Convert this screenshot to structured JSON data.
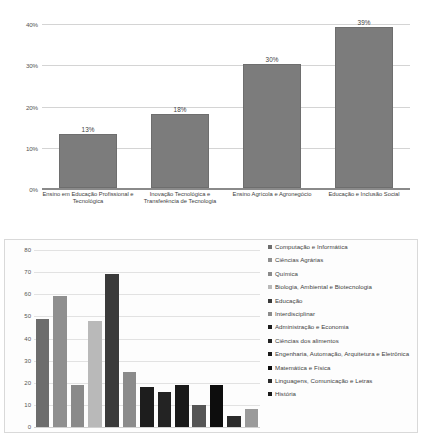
{
  "chart_data": [
    {
      "type": "bar",
      "id": "top-chart",
      "title": "",
      "xlabel": "",
      "ylabel": "",
      "ylim": [
        0,
        40
      ],
      "grid": true,
      "legend": "none",
      "ytick_labels": [
        "40%",
        "30%",
        "20%",
        "10%",
        "0%"
      ],
      "yticks": [
        40,
        30,
        20,
        10,
        0
      ],
      "categories": [
        "Ensino em Educação Profissional e Tecnológica",
        "Inovação Tecnológica e Transferência de Tecnologia",
        "Ensino Agrícola e Agronegócio",
        "Educação e Inclusão Social"
      ],
      "values": [
        13,
        18,
        30,
        39
      ],
      "data_labels": [
        "13%",
        "18%",
        "30%",
        "39%"
      ],
      "bar_color": "#7c7c7c"
    },
    {
      "type": "bar",
      "id": "bottom-chart",
      "title": "",
      "xlabel": "",
      "ylabel": "",
      "ylim": [
        0,
        80
      ],
      "grid": true,
      "legend": "right",
      "ytick_labels": [
        "80",
        "70",
        "60",
        "50",
        "40",
        "30",
        "20",
        "10",
        "0"
      ],
      "yticks": [
        80,
        70,
        60,
        50,
        40,
        30,
        20,
        10,
        0
      ],
      "categories": [
        "Computação e Informática",
        "Ciências Agrárias",
        "Química",
        "Biologia, Ambiental e Biotecnologia",
        "Educação",
        "Interdisciplinar",
        "Administração e Economia",
        "Ciências dos alimentos",
        "Engenharia, Automação, Arquitetura e Eletrônica",
        "Matemática e Física",
        "Linguagens, Comunicação e Letras",
        "História"
      ],
      "values": [
        49,
        59,
        19,
        48,
        69,
        25,
        18,
        16,
        19,
        10,
        19,
        5
      ],
      "extra_values": [
        8
      ],
      "bar_colors": [
        "#6d6d6d",
        "#8f8f8f",
        "#8a8a8a",
        "#b9b9b9",
        "#3a3a3a",
        "#8b8b8b",
        "#1d1d1d",
        "#232323",
        "#1a1a1a",
        "#555555",
        "#0d0d0d",
        "#2b2b2b",
        "#9a9a9a"
      ],
      "legend_swatch_colors": [
        "#6d6d6d",
        "#8f8f8f",
        "#8a8a8a",
        "#b9b9b9",
        "#3a3a3a",
        "#8b8b8b",
        "#1d1d1d",
        "#232323",
        "#1a1a1a",
        "#0d0d0d",
        "#2b2b2b",
        "#1a1a1a"
      ]
    }
  ],
  "top_chart": {
    "yticks": [
      {
        "label": "40%",
        "value": 40
      },
      {
        "label": "30%",
        "value": 30
      },
      {
        "label": "20%",
        "value": 20
      },
      {
        "label": "10%",
        "value": 10
      },
      {
        "label": "0%",
        "value": 0
      }
    ],
    "bars": [
      {
        "label": "Ensino em Educação Profissional e Tecnológica",
        "value": 13,
        "data_label": "13%"
      },
      {
        "label": "Inovação Tecnológica e Transferência de Tecnologia",
        "value": 18,
        "data_label": "18%"
      },
      {
        "label": "Ensino Agrícola e Agronegócio",
        "value": 30,
        "data_label": "30%"
      },
      {
        "label": "Educação e Inclusão Social",
        "value": 39,
        "data_label": "39%"
      }
    ]
  },
  "bottom_chart": {
    "yticks": [
      {
        "label": "80",
        "value": 80
      },
      {
        "label": "70",
        "value": 70
      },
      {
        "label": "60",
        "value": 60
      },
      {
        "label": "50",
        "value": 50
      },
      {
        "label": "40",
        "value": 40
      },
      {
        "label": "30",
        "value": 30
      },
      {
        "label": "20",
        "value": 20
      },
      {
        "label": "10",
        "value": 10
      },
      {
        "label": "0",
        "value": 0
      }
    ],
    "bars": [
      {
        "value": 49,
        "color": "#6d6d6d"
      },
      {
        "value": 59,
        "color": "#8f8f8f"
      },
      {
        "value": 19,
        "color": "#8a8a8a"
      },
      {
        "value": 48,
        "color": "#b9b9b9"
      },
      {
        "value": 69,
        "color": "#3a3a3a"
      },
      {
        "value": 25,
        "color": "#8b8b8b"
      },
      {
        "value": 18,
        "color": "#1d1d1d"
      },
      {
        "value": 16,
        "color": "#232323"
      },
      {
        "value": 19,
        "color": "#1a1a1a"
      },
      {
        "value": 10,
        "color": "#555555"
      },
      {
        "value": 19,
        "color": "#0d0d0d"
      },
      {
        "value": 5,
        "color": "#2b2b2b"
      },
      {
        "value": 8,
        "color": "#9a9a9a"
      }
    ],
    "legend": [
      {
        "label": "Computação e Informática",
        "color": "#6d6d6d"
      },
      {
        "label": "Ciências Agrárias",
        "color": "#8f8f8f"
      },
      {
        "label": "Química",
        "color": "#8a8a8a"
      },
      {
        "label": "Biologia, Ambiental e Biotecnologia",
        "color": "#b9b9b9"
      },
      {
        "label": "Educação",
        "color": "#3a3a3a"
      },
      {
        "label": "Interdisciplinar",
        "color": "#8b8b8b"
      },
      {
        "label": "Administração e Economia",
        "color": "#1d1d1d"
      },
      {
        "label": "Ciências dos alimentos",
        "color": "#232323"
      },
      {
        "label": "Engenharia, Automação, Arquitetura e Eletrônica",
        "color": "#1a1a1a"
      },
      {
        "label": "Matemática e Física",
        "color": "#0d0d0d"
      },
      {
        "label": "Linguagens, Comunicação e Letras",
        "color": "#2b2b2b"
      },
      {
        "label": "História",
        "color": "#1a1a1a"
      }
    ]
  }
}
